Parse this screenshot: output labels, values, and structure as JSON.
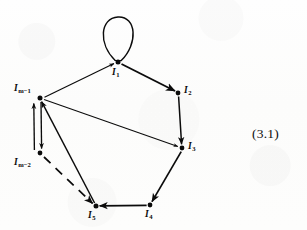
{
  "figure": {
    "equation_number": "(3.1)",
    "ink_color": "#0b0b0b",
    "paper_color": "#fdfdfc"
  },
  "nodes": [
    {
      "id": "I1",
      "base": "I",
      "subscript": "1",
      "label": "I₁",
      "x": 118,
      "y": 62,
      "label_x": 112,
      "label_y": 68
    },
    {
      "id": "I2",
      "base": "I",
      "subscript": "2",
      "label": "I₂",
      "x": 178,
      "y": 93,
      "label_x": 184,
      "label_y": 86
    },
    {
      "id": "I3",
      "base": "I",
      "subscript": "3",
      "label": "I₃",
      "x": 182,
      "y": 148,
      "label_x": 188,
      "label_y": 142
    },
    {
      "id": "I4",
      "base": "I",
      "subscript": "4",
      "label": "I₄",
      "x": 150,
      "y": 205,
      "label_x": 145,
      "label_y": 210
    },
    {
      "id": "I5",
      "base": "I",
      "subscript": "5",
      "label": "I₅",
      "x": 96,
      "y": 206,
      "label_x": 88,
      "label_y": 211
    },
    {
      "id": "Im2",
      "base": "I",
      "subscript": "m−2",
      "label": "Iₘ₋₂",
      "x": 40,
      "y": 153,
      "label_x": 14,
      "label_y": 158
    },
    {
      "id": "Im1",
      "base": "I",
      "subscript": "m−1",
      "label": "Iₘ₋₁",
      "x": 40,
      "y": 98,
      "label_x": 14,
      "label_y": 84
    }
  ],
  "edges": [
    {
      "from": "I1",
      "to": "I1",
      "kind": "self-loop",
      "style": "solid",
      "arrow": false
    },
    {
      "from": "Im1",
      "to": "I1",
      "kind": "straight",
      "style": "solid",
      "arrow": true
    },
    {
      "from": "I1",
      "to": "I2",
      "kind": "straight",
      "style": "solid",
      "arrow": true
    },
    {
      "from": "I2",
      "to": "I3",
      "kind": "straight",
      "style": "solid",
      "arrow": true
    },
    {
      "from": "Im1",
      "to": "I3",
      "kind": "straight",
      "style": "solid",
      "arrow": true
    },
    {
      "from": "I3",
      "to": "I4",
      "kind": "straight",
      "style": "solid",
      "arrow": true
    },
    {
      "from": "I4",
      "to": "I5",
      "kind": "straight",
      "style": "solid",
      "arrow": true
    },
    {
      "from": "I5",
      "to": "Im1",
      "kind": "straight",
      "style": "solid",
      "arrow": true
    },
    {
      "from": "Im1",
      "to": "Im2",
      "kind": "parallel-right",
      "style": "solid",
      "arrow": true
    },
    {
      "from": "Im2",
      "to": "Im1",
      "kind": "parallel-left",
      "style": "solid",
      "arrow": true
    },
    {
      "from": "Im2",
      "to": "I5",
      "kind": "straight",
      "style": "dashed",
      "arrow": true
    }
  ]
}
